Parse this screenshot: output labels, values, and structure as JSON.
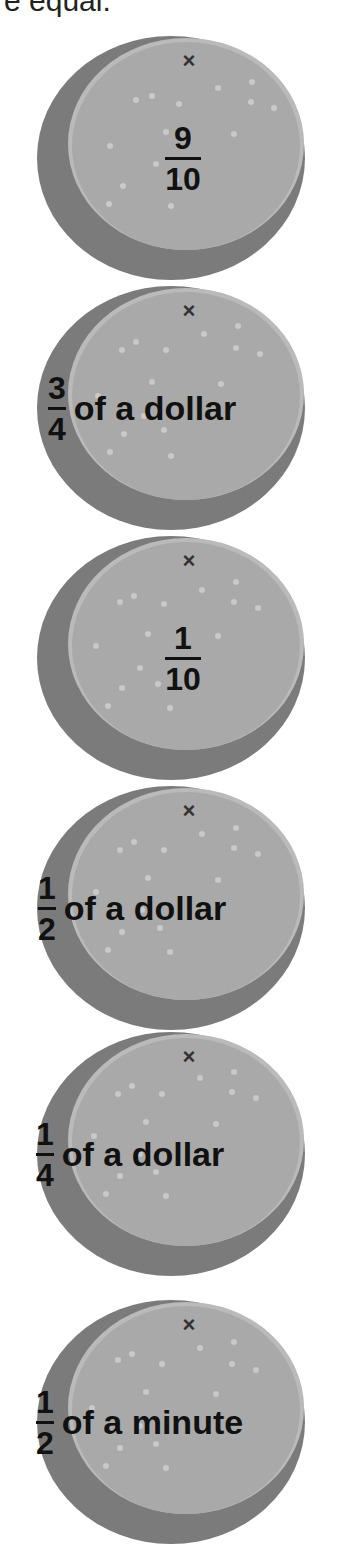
{
  "header": {
    "text": "re equal."
  },
  "colors": {
    "rim_dark": "#7b7b7b",
    "face": "#a9a9a9",
    "rim_light": "#bababa",
    "dot": "#c9c9c9",
    "text": "#111111"
  },
  "coins": [
    {
      "numerator": "9",
      "denominator": "10",
      "suffix": "",
      "mark": "×"
    },
    {
      "numerator": "3",
      "denominator": "4",
      "suffix": "of a dollar",
      "mark": "×"
    },
    {
      "numerator": "1",
      "denominator": "10",
      "suffix": "",
      "mark": "×"
    },
    {
      "numerator": "1",
      "denominator": "2",
      "suffix": "of a dollar",
      "mark": "×"
    },
    {
      "numerator": "1",
      "denominator": "4",
      "suffix": "of a dollar",
      "mark": "×"
    },
    {
      "numerator": "1",
      "denominator": "2",
      "suffix": "of a minute",
      "mark": "×"
    }
  ]
}
